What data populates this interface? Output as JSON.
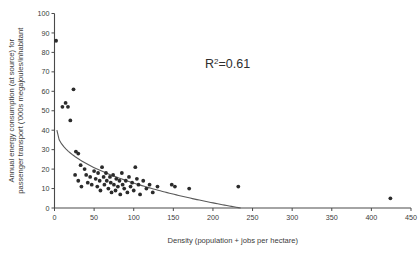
{
  "chart_data": {
    "type": "scatter",
    "title": "",
    "xlabel": "Density (population + jobs per hectare)",
    "ylabel": "Annual energy consumption (at source) for passenger transport ('000s megajoules/inhabitant",
    "ylabel_line1": "Annual energy consumption (at source) for",
    "ylabel_line2": "passenger transport ('000s megajoules/inhabitant",
    "xlim": [
      0,
      450
    ],
    "ylim": [
      0,
      100
    ],
    "xticks": [
      0,
      50,
      100,
      150,
      200,
      250,
      300,
      350,
      400,
      450
    ],
    "yticks": [
      0,
      10,
      20,
      30,
      40,
      50,
      60,
      70,
      80,
      90,
      100
    ],
    "grid": false,
    "legend": false,
    "annotations": [
      {
        "name": "r-squared",
        "text": "R²=0.61",
        "base": "R",
        "sup": "2",
        "tail": "=0.61",
        "x": 205,
        "y": 68
      }
    ],
    "marker": {
      "shape": "circle",
      "radius": 1.9,
      "color": "#2b2b2b"
    },
    "trendline": {
      "present": true,
      "style": "power-decay",
      "color": "#5a5a5a",
      "x_start": 3,
      "y_start": 40,
      "x_end": 235,
      "y_end": 0
    },
    "points": [
      {
        "x": 2,
        "y": 86
      },
      {
        "x": 24,
        "y": 61
      },
      {
        "x": 14,
        "y": 54
      },
      {
        "x": 10,
        "y": 52
      },
      {
        "x": 17,
        "y": 52
      },
      {
        "x": 20,
        "y": 45
      },
      {
        "x": 27,
        "y": 29
      },
      {
        "x": 30,
        "y": 28
      },
      {
        "x": 33,
        "y": 22
      },
      {
        "x": 26,
        "y": 17
      },
      {
        "x": 30,
        "y": 14
      },
      {
        "x": 34,
        "y": 11
      },
      {
        "x": 38,
        "y": 20
      },
      {
        "x": 40,
        "y": 17
      },
      {
        "x": 42,
        "y": 13
      },
      {
        "x": 45,
        "y": 16
      },
      {
        "x": 47,
        "y": 12
      },
      {
        "x": 50,
        "y": 19
      },
      {
        "x": 52,
        "y": 15
      },
      {
        "x": 54,
        "y": 11
      },
      {
        "x": 55,
        "y": 18
      },
      {
        "x": 57,
        "y": 14
      },
      {
        "x": 58,
        "y": 9
      },
      {
        "x": 60,
        "y": 21
      },
      {
        "x": 62,
        "y": 16
      },
      {
        "x": 63,
        "y": 12
      },
      {
        "x": 65,
        "y": 18
      },
      {
        "x": 66,
        "y": 14
      },
      {
        "x": 68,
        "y": 10
      },
      {
        "x": 70,
        "y": 16
      },
      {
        "x": 71,
        "y": 13
      },
      {
        "x": 72,
        "y": 8
      },
      {
        "x": 74,
        "y": 17
      },
      {
        "x": 75,
        "y": 12
      },
      {
        "x": 77,
        "y": 9
      },
      {
        "x": 78,
        "y": 15
      },
      {
        "x": 80,
        "y": 11
      },
      {
        "x": 82,
        "y": 14
      },
      {
        "x": 83,
        "y": 7
      },
      {
        "x": 85,
        "y": 18
      },
      {
        "x": 86,
        "y": 12
      },
      {
        "x": 88,
        "y": 10
      },
      {
        "x": 90,
        "y": 14
      },
      {
        "x": 92,
        "y": 8
      },
      {
        "x": 94,
        "y": 16
      },
      {
        "x": 96,
        "y": 11
      },
      {
        "x": 98,
        "y": 13
      },
      {
        "x": 100,
        "y": 9
      },
      {
        "x": 102,
        "y": 21
      },
      {
        "x": 104,
        "y": 15
      },
      {
        "x": 106,
        "y": 12
      },
      {
        "x": 108,
        "y": 7
      },
      {
        "x": 112,
        "y": 14
      },
      {
        "x": 116,
        "y": 10
      },
      {
        "x": 120,
        "y": 12
      },
      {
        "x": 124,
        "y": 8
      },
      {
        "x": 130,
        "y": 11
      },
      {
        "x": 148,
        "y": 12
      },
      {
        "x": 152,
        "y": 11
      },
      {
        "x": 170,
        "y": 10
      },
      {
        "x": 232,
        "y": 11
      },
      {
        "x": 424,
        "y": 5
      }
    ]
  }
}
